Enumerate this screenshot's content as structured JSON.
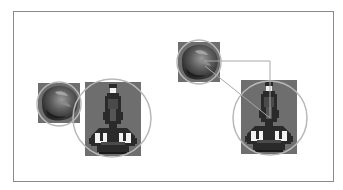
{
  "diagram": {
    "colors": {
      "background": "#ffffff",
      "frame": "#8a8a8a",
      "sprite_box": "#6e6e6e",
      "bounding_circle": "#b8b8b8",
      "distance_line": "#a8a8a8",
      "rock_dark": "#2e2e2e",
      "rock_mid": "#5a5a5a",
      "rock_light": "#8c8c8c",
      "ship_dark": "#2a2a2a",
      "ship_mid": "#4a4a4a",
      "ship_light": "#f2f2f2"
    },
    "panels": [
      {
        "name": "no-collision",
        "asteroid": {
          "box": [
            38,
            83,
            42,
            40
          ],
          "circle": {
            "cx": 59,
            "cy": 104,
            "r": 22
          }
        },
        "ship": {
          "box": [
            85,
            82,
            57,
            74
          ],
          "circle": {
            "cx": 112,
            "cy": 118,
            "r": 39
          }
        }
      },
      {
        "name": "distance-check",
        "asteroid": {
          "box": [
            178,
            42,
            42,
            40
          ],
          "circle": {
            "cx": 199,
            "cy": 62,
            "r": 22
          }
        },
        "ship": {
          "box": [
            241,
            80,
            56,
            74
          ],
          "circle": {
            "cx": 270,
            "cy": 118,
            "r": 37
          }
        },
        "lines": {
          "dx": [
            204,
            61,
            270,
            61
          ],
          "dy": [
            270,
            61,
            270,
            118
          ],
          "distance": [
            205,
            66,
            270,
            118
          ]
        }
      }
    ]
  }
}
